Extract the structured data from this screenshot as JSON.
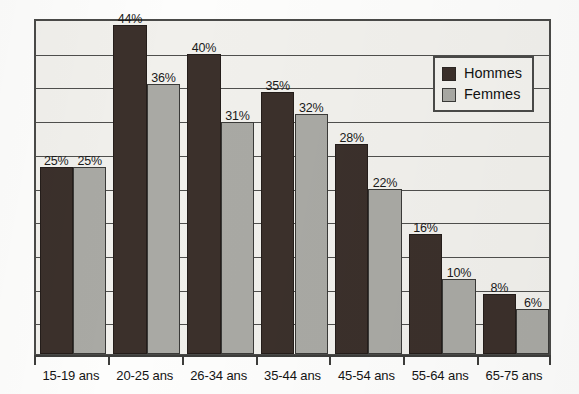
{
  "chart_data": {
    "type": "bar",
    "title": "",
    "xlabel": "",
    "ylabel": "",
    "ylim": [
      0,
      45
    ],
    "grid": true,
    "gridline_count": 9,
    "legend_position": "top-right",
    "value_suffix": "%",
    "categories": [
      "15-19 ans",
      "20-25 ans",
      "26-34 ans",
      "35-44 ans",
      "45-54 ans",
      "55-64 ans",
      "65-75 ans"
    ],
    "series": [
      {
        "name": "Hommes",
        "color": "#3b302b",
        "values": [
          25,
          44,
          40,
          35,
          28,
          16,
          8
        ],
        "labels": [
          "25%",
          "44%",
          "40%",
          "35%",
          "28%",
          "16%",
          "8%"
        ]
      },
      {
        "name": "Femmes",
        "color": "#a9a9a4",
        "values": [
          25,
          36,
          31,
          32,
          22,
          10,
          6
        ],
        "labels": [
          "25%",
          "36%",
          "31%",
          "32%",
          "22%",
          "10%",
          "6%"
        ]
      }
    ]
  },
  "legend": {
    "entries": [
      {
        "label": "Hommes",
        "color": "#3b302b"
      },
      {
        "label": "Femmes",
        "color": "#a9a9a4"
      }
    ]
  },
  "colors": {
    "series_hommes": "#3b302b",
    "series_femmes": "#a9a9a4",
    "plot_background": "#f1f0ec",
    "frame": "#4a4a48",
    "gridline": "#4f4f4d",
    "text": "#141414"
  }
}
